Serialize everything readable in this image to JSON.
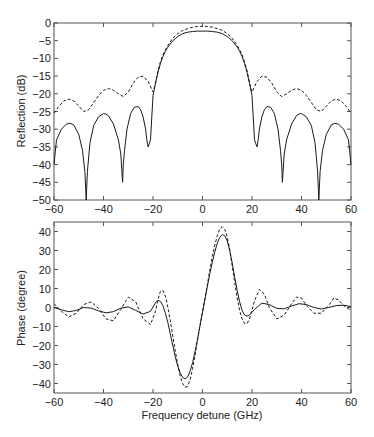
{
  "chart_data": [
    {
      "type": "line",
      "title": "",
      "xlabel": "",
      "ylabel": "Reflection (dB)",
      "xlim": [
        -60,
        60
      ],
      "ylim": [
        -50,
        0
      ],
      "grid": false,
      "legend": null,
      "xticks": [
        -60,
        -40,
        -20,
        0,
        20,
        40,
        60
      ],
      "yticks": [
        0,
        -5,
        -10,
        -15,
        -20,
        -25,
        -30,
        -35,
        -40,
        -45,
        -50
      ],
      "series": [
        {
          "name": "solid",
          "style": "solid",
          "x": [
            -60,
            -59,
            -57,
            -55,
            -53.5,
            -52,
            -50,
            -48.5,
            -47.5,
            -47,
            -46.5,
            -45.5,
            -44,
            -42,
            -40,
            -39,
            -38,
            -36,
            -34,
            -33,
            -32.3,
            -32,
            -31.5,
            -30.5,
            -29,
            -27.5,
            -26,
            -25,
            -24,
            -23,
            -22.5,
            -22,
            -21.5,
            -21,
            -20,
            -19,
            -18,
            -17,
            -16,
            -15,
            -14,
            -12,
            -10,
            -8,
            -6,
            -4,
            -2,
            0,
            2,
            4,
            6,
            8,
            10,
            12,
            14,
            15,
            16,
            17,
            18,
            19,
            20,
            21,
            21.5,
            22,
            22.5,
            23,
            24,
            25,
            26,
            27.5,
            29,
            30.5,
            31.5,
            32,
            32.3,
            33,
            34,
            36,
            38,
            39,
            40,
            42,
            44,
            45.5,
            46.5,
            47,
            47.5,
            48.5,
            50,
            52,
            53.5,
            55,
            57,
            59,
            60
          ],
          "y": [
            -40,
            -33,
            -30,
            -28.6,
            -28.3,
            -28.8,
            -31.5,
            -36,
            -42,
            -50,
            -42,
            -34,
            -29,
            -26.5,
            -25.6,
            -25.7,
            -26.2,
            -28.5,
            -33,
            -37,
            -45,
            -40,
            -36,
            -30,
            -25.5,
            -23.8,
            -23.6,
            -24.5,
            -26.5,
            -30,
            -33,
            -35,
            -34,
            -33,
            -20.5,
            -17,
            -14,
            -11.5,
            -9.5,
            -8,
            -6.8,
            -5,
            -3.8,
            -3,
            -2.6,
            -2.4,
            -2.3,
            -2.3,
            -2.3,
            -2.4,
            -2.6,
            -3,
            -3.8,
            -5,
            -6.8,
            -8,
            -9.5,
            -11.5,
            -14,
            -17,
            -20.5,
            -33,
            -34,
            -35,
            -33,
            -30,
            -26.5,
            -24.5,
            -23.6,
            -23.8,
            -25.5,
            -30,
            -36,
            -40,
            -45,
            -37,
            -33,
            -28.5,
            -26.2,
            -25.7,
            -25.6,
            -26.5,
            -29,
            -34,
            -42,
            -50,
            -42,
            -36,
            -31.5,
            -28.8,
            -28.3,
            -28.6,
            -30,
            -33,
            -40
          ]
        },
        {
          "name": "dashed",
          "style": "dashed",
          "x": [
            -60,
            -58,
            -56,
            -54,
            -52,
            -50,
            -48,
            -46,
            -44,
            -42,
            -40,
            -38,
            -36,
            -34,
            -32,
            -30,
            -28,
            -26,
            -24,
            -22,
            -20,
            -19,
            -18,
            -17,
            -16,
            -15,
            -14,
            -12,
            -10,
            -8,
            -6,
            -4,
            -2,
            0,
            2,
            4,
            6,
            8,
            10,
            12,
            14,
            15,
            16,
            17,
            18,
            19,
            20,
            22,
            24,
            26,
            28,
            30,
            32,
            34,
            36,
            38,
            40,
            42,
            44,
            46,
            48,
            50,
            52,
            54,
            56,
            58,
            60
          ],
          "y": [
            -25.5,
            -23.5,
            -22,
            -21.5,
            -22,
            -23.5,
            -25,
            -24.5,
            -22.5,
            -20.5,
            -19,
            -18.5,
            -19,
            -20,
            -20.8,
            -19.5,
            -17,
            -15.3,
            -15,
            -16.5,
            -19.5,
            -17,
            -13.5,
            -11,
            -9,
            -7.5,
            -6.3,
            -4.3,
            -3,
            -2.1,
            -1.6,
            -1.2,
            -1,
            -0.9,
            -1,
            -1.2,
            -1.6,
            -2.1,
            -3,
            -4.3,
            -6.3,
            -7.5,
            -9,
            -11,
            -13.5,
            -17,
            -19.5,
            -16.5,
            -15,
            -15.3,
            -17,
            -19.5,
            -20.8,
            -20,
            -19,
            -18.5,
            -19,
            -20.5,
            -22.5,
            -24.5,
            -25,
            -23.5,
            -22,
            -21.5,
            -22,
            -23.5,
            -25.5
          ]
        }
      ]
    },
    {
      "type": "line",
      "title": "",
      "xlabel": "Frequency detune (GHz)",
      "ylabel": "Phase (degree)",
      "xlim": [
        -60,
        60
      ],
      "ylim": [
        -45,
        45
      ],
      "grid": false,
      "legend": null,
      "xticks": [
        -60,
        -40,
        -20,
        0,
        20,
        40,
        60
      ],
      "yticks": [
        40,
        30,
        20,
        10,
        0,
        -10,
        -20,
        -30,
        -40
      ],
      "series": [
        {
          "name": "solid",
          "style": "solid",
          "x": [
            -60,
            -57,
            -54,
            -51,
            -48,
            -45,
            -42,
            -39,
            -36,
            -33,
            -30,
            -27,
            -24,
            -21,
            -19,
            -18,
            -17,
            -16,
            -15,
            -14,
            -13,
            -12,
            -11,
            -10,
            -9,
            -8,
            -7,
            -6,
            -5,
            -4,
            -3,
            -2,
            -1,
            0,
            1,
            2,
            3,
            4,
            5,
            6,
            7,
            8,
            9,
            10,
            11,
            12,
            13,
            14,
            15,
            16,
            17,
            18,
            19,
            21,
            24,
            27,
            30,
            33,
            36,
            39,
            42,
            45,
            48,
            51,
            54,
            57,
            60
          ],
          "y": [
            0,
            -1.2,
            -2.2,
            -1.5,
            0,
            -0.3,
            -1.8,
            -2.8,
            -2.2,
            -0.3,
            0.3,
            -1.5,
            -3.5,
            -2,
            2.5,
            3.8,
            3.2,
            1,
            -3,
            -8,
            -14,
            -20,
            -26,
            -31,
            -34.5,
            -36.8,
            -37.5,
            -36.5,
            -33.5,
            -29,
            -23,
            -16.5,
            -9.5,
            -2.5,
            4.5,
            11.5,
            18,
            24,
            29.5,
            34,
            37,
            38.3,
            37.8,
            35,
            30,
            23.5,
            16,
            9,
            3,
            -1.5,
            -4,
            -4.6,
            -4,
            -1,
            2.3,
            1.5,
            -0.5,
            -0.7,
            0.8,
            2,
            1.5,
            0,
            -0.8,
            0,
            1,
            1.2,
            0.5
          ]
        },
        {
          "name": "dashed",
          "style": "dashed",
          "x": [
            -60,
            -57,
            -54,
            -51,
            -48,
            -45,
            -42,
            -39,
            -36,
            -33,
            -30,
            -27,
            -24,
            -21,
            -19,
            -18,
            -17,
            -16,
            -15,
            -14,
            -13,
            -12,
            -11,
            -10,
            -9,
            -8,
            -7,
            -6,
            -5,
            -4,
            -3,
            -2,
            -1,
            0,
            1,
            2,
            3,
            4,
            5,
            6,
            7,
            8,
            9,
            10,
            11,
            12,
            13,
            14,
            15,
            16,
            17,
            18,
            19,
            21,
            23,
            25,
            27,
            30,
            33,
            36,
            38,
            40,
            42,
            45,
            48,
            51,
            53,
            55,
            57,
            60
          ],
          "y": [
            2,
            -2,
            -5,
            -3,
            1.5,
            3,
            -0.5,
            -6,
            -7,
            -1,
            5.5,
            3,
            -6,
            -9,
            -2,
            4,
            8.5,
            9,
            6,
            0,
            -7,
            -15,
            -23,
            -30,
            -36,
            -40,
            -42,
            -41.5,
            -38,
            -32,
            -25,
            -17,
            -9.5,
            -2.5,
            5,
            12.5,
            20,
            27,
            33,
            38,
            41.5,
            42.5,
            41,
            37,
            30.5,
            22,
            13,
            5,
            -1.5,
            -6,
            -8.5,
            -8.5,
            -6,
            3.5,
            9.5,
            7,
            0,
            -6,
            -4,
            2,
            5.5,
            5,
            1,
            -3,
            -3,
            1,
            5,
            4,
            1,
            -1.5
          ]
        }
      ]
    }
  ],
  "plots": {
    "top": {
      "ylabel": "Reflection (dB)",
      "xtick_labels": [
        "−60",
        "−40",
        "−20",
        "0",
        "20",
        "40",
        "60"
      ],
      "ytick_labels": [
        "0",
        "−5",
        "−10",
        "−15",
        "−20",
        "−25",
        "−30",
        "−35",
        "−40",
        "−45",
        "−50"
      ]
    },
    "bottom": {
      "ylabel": "Phase (degree)",
      "xlabel": "Frequency detune (GHz)",
      "xtick_labels": [
        "−60",
        "−40",
        "−20",
        "0",
        "20",
        "40",
        "60"
      ],
      "ytick_labels": [
        "40",
        "30",
        "20",
        "10",
        "0",
        "−10",
        "−20",
        "−30",
        "−40"
      ]
    }
  },
  "colors": {
    "line": "#1a1a1a",
    "axis": "#555555",
    "background": "#ffffff"
  }
}
